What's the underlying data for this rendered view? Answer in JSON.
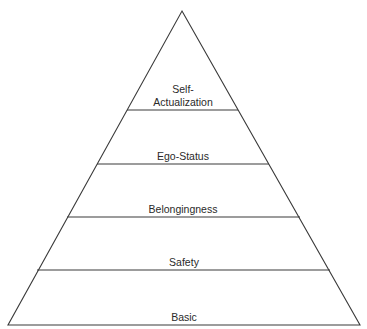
{
  "diagram": {
    "type": "pyramid",
    "title": "",
    "levels": [
      {
        "id": "self-actualization",
        "label_line1": "Self-",
        "label_line2": "Actualization",
        "order_from_top": 1
      },
      {
        "id": "ego-status",
        "label": "Ego-Status",
        "order_from_top": 2
      },
      {
        "id": "belongingness",
        "label": "Belongingness",
        "order_from_top": 3
      },
      {
        "id": "safety",
        "label": "Safety",
        "order_from_top": 4
      },
      {
        "id": "basic",
        "label": "Basic",
        "order_from_top": 5
      }
    ],
    "colors": {
      "stroke": "#3a3a3a",
      "text": "#2a2a2a",
      "fill": "#ffffff"
    }
  }
}
